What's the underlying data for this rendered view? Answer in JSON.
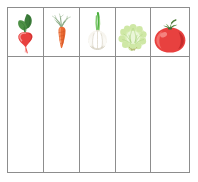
{
  "worksheet": {
    "title": "Vegetable picture sorting grid",
    "background_color": "#ffffff",
    "border_color": "#8d8d8d",
    "columns": 5,
    "rows": 2
  },
  "header_row": {
    "name": "picture-header-row",
    "cells": [
      {
        "icon": "radish-icon",
        "label": "Radish",
        "colors": {
          "body": "#e8413f",
          "body_light": "#f4807e",
          "leaf": "#3b7a3a",
          "leaf_light": "#5a9e52"
        }
      },
      {
        "icon": "carrot-icon",
        "label": "Carrot",
        "colors": {
          "body": "#ec6b33",
          "body_light": "#f59a63",
          "leaf": "#8fae8a",
          "leaf_light": "#b3c9ad"
        }
      },
      {
        "icon": "garlic-icon",
        "label": "Garlic",
        "colors": {
          "body": "#f6f4ee",
          "body_light": "#ffffff",
          "shade": "#d8d4c6",
          "leaf": "#4caf3f",
          "leaf_light": "#7cc96b"
        }
      },
      {
        "icon": "lettuce-icon",
        "label": "Lettuce",
        "colors": {
          "body": "#d7ecb4",
          "body_light": "#eaf6d6",
          "leaf": "#a9d277",
          "leaf_light": "#c6e39d"
        }
      },
      {
        "icon": "tomato-icon",
        "label": "Tomato",
        "colors": {
          "body": "#e8413f",
          "body_light": "#f4706c",
          "shade": "#c62c2b",
          "leaf": "#4f7d3b",
          "leaf_light": "#6f9b4f"
        }
      }
    ]
  },
  "answer_row": {
    "name": "answer-row",
    "cells": [
      {
        "value": ""
      },
      {
        "value": ""
      },
      {
        "value": ""
      },
      {
        "value": ""
      },
      {
        "value": ""
      }
    ]
  }
}
